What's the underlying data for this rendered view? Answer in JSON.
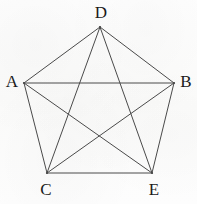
{
  "figure": {
    "type": "complete-graph-k5",
    "caption": "",
    "background_color": "#fdfdfc",
    "edge_color": "#4a4a4a",
    "label_color": "#1a1a1a",
    "edge_width": 1
  },
  "vertices": [
    {
      "id": "D",
      "label": "D",
      "x": 100,
      "y": 27,
      "label_x": 101,
      "label_y": 12
    },
    {
      "id": "A",
      "label": "A",
      "x": 24,
      "y": 83,
      "label_x": 12,
      "label_y": 81
    },
    {
      "id": "B",
      "label": "B",
      "x": 174,
      "y": 83,
      "label_x": 186,
      "label_y": 81
    },
    {
      "id": "C",
      "label": "C",
      "x": 47,
      "y": 173,
      "label_x": 46,
      "label_y": 189
    },
    {
      "id": "E",
      "label": "E",
      "x": 152,
      "y": 173,
      "label_x": 154,
      "label_y": 189
    }
  ],
  "edges": [
    {
      "from": "D",
      "to": "A",
      "kind": "side"
    },
    {
      "from": "D",
      "to": "B",
      "kind": "side"
    },
    {
      "from": "A",
      "to": "C",
      "kind": "side"
    },
    {
      "from": "B",
      "to": "E",
      "kind": "side"
    },
    {
      "from": "C",
      "to": "E",
      "kind": "side"
    },
    {
      "from": "A",
      "to": "B",
      "kind": "diagonal"
    },
    {
      "from": "D",
      "to": "C",
      "kind": "diagonal"
    },
    {
      "from": "D",
      "to": "E",
      "kind": "diagonal"
    },
    {
      "from": "A",
      "to": "E",
      "kind": "diagonal"
    },
    {
      "from": "B",
      "to": "C",
      "kind": "diagonal"
    }
  ]
}
